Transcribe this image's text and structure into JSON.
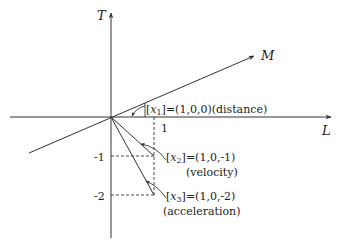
{
  "axes": {
    "T": "T",
    "L": "L",
    "M": "M"
  },
  "ticks": {
    "x_one": "1",
    "y_minus_one": "-1",
    "y_minus_two": "-2"
  },
  "vectors": [
    {
      "name": "x",
      "sub": "1",
      "coords": "=(1,0,0)",
      "desc": "(distance)"
    },
    {
      "name": "x",
      "sub": "2",
      "coords": "=(1,0,-1)",
      "desc": "(velocity)"
    },
    {
      "name": "x",
      "sub": "3",
      "coords": "=(1,0,-2)",
      "desc": "(acceleration)"
    }
  ],
  "colors": {
    "line": "#333333",
    "text": "#222222"
  }
}
